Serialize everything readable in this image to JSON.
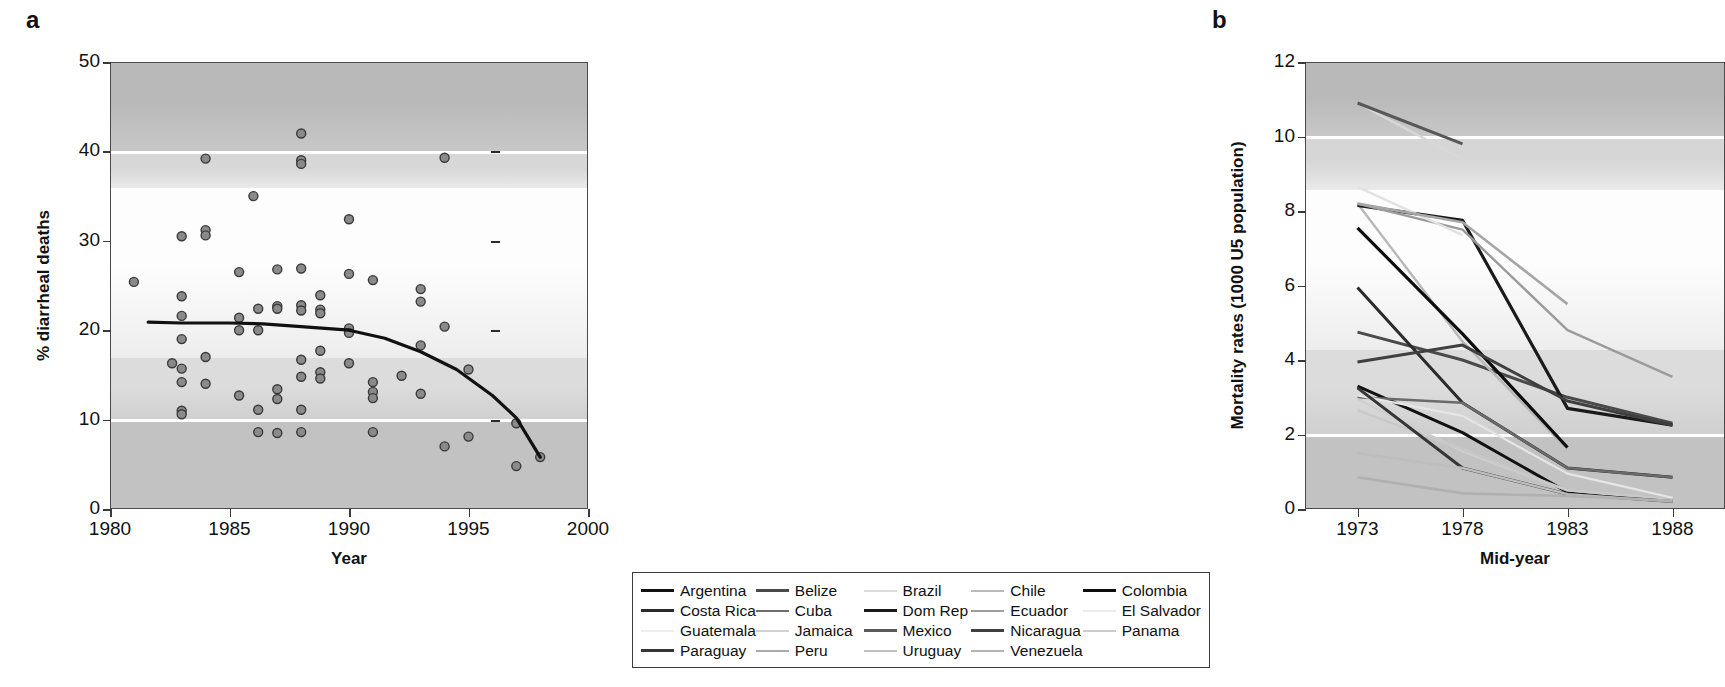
{
  "figure": {
    "panel_a_label": "a",
    "panel_b_label": "b"
  },
  "chart_data": [
    {
      "id": "panel_a",
      "type": "scatter",
      "title": "",
      "xlabel": "Year",
      "ylabel": "% diarrheal deaths",
      "xlim": [
        1980,
        2000
      ],
      "ylim": [
        0,
        50
      ],
      "xticks": [
        1980,
        1985,
        1990,
        1995,
        2000
      ],
      "xtick_labels": [
        "1980",
        "1985",
        "1990",
        "1995",
        "2000"
      ],
      "yticks": [
        0,
        10,
        20,
        30,
        40,
        50
      ],
      "ytick_labels": [
        "0",
        "10",
        "20",
        "30",
        "40",
        "50"
      ],
      "grid": false,
      "background_bands": [
        {
          "from": 50,
          "to": 40,
          "shade": "#b9b9b9"
        },
        {
          "from": 40,
          "to": 36,
          "shade": "#d7d7d7"
        },
        {
          "from": 36,
          "to": 17,
          "shade": "#fdfdfd"
        },
        {
          "from": 17,
          "to": 10,
          "shade": "#dcdcdc"
        },
        {
          "from": 10,
          "to": 0,
          "shade": "#c2c2c2"
        }
      ],
      "white_rule_lines": [
        40,
        10
      ],
      "inner_right_ticks": [
        40,
        30,
        20,
        10
      ],
      "marker_style": {
        "shape": "circle",
        "fill": "#8a8a8a",
        "edge": "#3a3a3a",
        "size": 9
      },
      "points": [
        {
          "x": 1981.0,
          "y": 25.4
        },
        {
          "x": 1983.0,
          "y": 30.5
        },
        {
          "x": 1983.0,
          "y": 23.8
        },
        {
          "x": 1983.0,
          "y": 21.6
        },
        {
          "x": 1983.0,
          "y": 19.0
        },
        {
          "x": 1983.0,
          "y": 15.7
        },
        {
          "x": 1983.0,
          "y": 14.2
        },
        {
          "x": 1983.0,
          "y": 11.0
        },
        {
          "x": 1983.0,
          "y": 10.6
        },
        {
          "x": 1982.6,
          "y": 16.3
        },
        {
          "x": 1984.0,
          "y": 39.2
        },
        {
          "x": 1984.0,
          "y": 31.2
        },
        {
          "x": 1984.0,
          "y": 30.6
        },
        {
          "x": 1984.0,
          "y": 17.0
        },
        {
          "x": 1984.0,
          "y": 14.0
        },
        {
          "x": 1985.4,
          "y": 26.5
        },
        {
          "x": 1985.4,
          "y": 21.4
        },
        {
          "x": 1985.4,
          "y": 20.0
        },
        {
          "x": 1985.4,
          "y": 12.7
        },
        {
          "x": 1986.0,
          "y": 35.0
        },
        {
          "x": 1986.2,
          "y": 22.4
        },
        {
          "x": 1986.2,
          "y": 20.0
        },
        {
          "x": 1986.2,
          "y": 11.1
        },
        {
          "x": 1986.2,
          "y": 8.6
        },
        {
          "x": 1987.0,
          "y": 26.8
        },
        {
          "x": 1987.0,
          "y": 22.7
        },
        {
          "x": 1987.0,
          "y": 22.4
        },
        {
          "x": 1987.0,
          "y": 13.4
        },
        {
          "x": 1987.0,
          "y": 12.3
        },
        {
          "x": 1987.0,
          "y": 8.5
        },
        {
          "x": 1988.0,
          "y": 42.0
        },
        {
          "x": 1988.0,
          "y": 39.0
        },
        {
          "x": 1988.0,
          "y": 38.6
        },
        {
          "x": 1988.0,
          "y": 26.9
        },
        {
          "x": 1988.0,
          "y": 22.8
        },
        {
          "x": 1988.0,
          "y": 22.2
        },
        {
          "x": 1988.0,
          "y": 16.7
        },
        {
          "x": 1988.0,
          "y": 14.8
        },
        {
          "x": 1988.0,
          "y": 11.1
        },
        {
          "x": 1988.0,
          "y": 8.6
        },
        {
          "x": 1988.8,
          "y": 23.9
        },
        {
          "x": 1988.8,
          "y": 22.3
        },
        {
          "x": 1988.8,
          "y": 21.9
        },
        {
          "x": 1988.8,
          "y": 17.7
        },
        {
          "x": 1988.8,
          "y": 15.3
        },
        {
          "x": 1988.8,
          "y": 14.6
        },
        {
          "x": 1990.0,
          "y": 32.4
        },
        {
          "x": 1990.0,
          "y": 26.3
        },
        {
          "x": 1990.0,
          "y": 20.2
        },
        {
          "x": 1990.0,
          "y": 19.7
        },
        {
          "x": 1990.0,
          "y": 16.3
        },
        {
          "x": 1991.0,
          "y": 25.6
        },
        {
          "x": 1991.0,
          "y": 14.2
        },
        {
          "x": 1991.0,
          "y": 13.1
        },
        {
          "x": 1991.0,
          "y": 12.4
        },
        {
          "x": 1991.0,
          "y": 8.6
        },
        {
          "x": 1992.2,
          "y": 14.9
        },
        {
          "x": 1993.0,
          "y": 24.6
        },
        {
          "x": 1993.0,
          "y": 23.2
        },
        {
          "x": 1993.0,
          "y": 18.3
        },
        {
          "x": 1993.0,
          "y": 12.9
        },
        {
          "x": 1994.0,
          "y": 39.3
        },
        {
          "x": 1994.0,
          "y": 20.4
        },
        {
          "x": 1994.0,
          "y": 7.0
        },
        {
          "x": 1995.0,
          "y": 15.6
        },
        {
          "x": 1995.0,
          "y": 8.1
        },
        {
          "x": 1997.0,
          "y": 9.6
        },
        {
          "x": 1997.0,
          "y": 4.8
        },
        {
          "x": 1998.0,
          "y": 5.8
        }
      ],
      "trend_line": {
        "label": "fitted trend",
        "color": "#111111",
        "width": 3.2,
        "points": [
          {
            "x": 1981.6,
            "y": 20.9
          },
          {
            "x": 1983.0,
            "y": 20.8
          },
          {
            "x": 1985.0,
            "y": 20.8
          },
          {
            "x": 1986.4,
            "y": 20.7
          },
          {
            "x": 1988.0,
            "y": 20.4
          },
          {
            "x": 1990.0,
            "y": 20.0
          },
          {
            "x": 1991.5,
            "y": 19.1
          },
          {
            "x": 1993.0,
            "y": 17.6
          },
          {
            "x": 1994.5,
            "y": 15.6
          },
          {
            "x": 1996.0,
            "y": 12.7
          },
          {
            "x": 1997.0,
            "y": 10.2
          },
          {
            "x": 1998.0,
            "y": 5.8
          }
        ]
      }
    },
    {
      "id": "panel_b",
      "type": "line",
      "title": "",
      "xlabel": "Mid-year",
      "ylabel": "Mortality rates (1000 U5 population)",
      "x": [
        1973,
        1978,
        1983,
        1988
      ],
      "xticks": [
        1973,
        1978,
        1983,
        1988
      ],
      "xtick_labels": [
        "1973",
        "1978",
        "1983",
        "1988"
      ],
      "xlim": [
        1970.5,
        1990.5
      ],
      "ylim": [
        0,
        12
      ],
      "yticks": [
        0,
        2,
        4,
        6,
        8,
        10,
        12
      ],
      "ytick_labels": [
        "0",
        "2",
        "4",
        "6",
        "8",
        "10",
        "12"
      ],
      "grid": false,
      "legend_position": "below",
      "background_bands": [
        {
          "from": 12,
          "to": 10,
          "shade": "#b9b9b9"
        },
        {
          "from": 10,
          "to": 8.6,
          "shade": "#d6d6d6"
        },
        {
          "from": 8.6,
          "to": 4.3,
          "shade": "#fdfdfd"
        },
        {
          "from": 4.3,
          "to": 2.0,
          "shade": "#dcdcdc"
        },
        {
          "from": 2.0,
          "to": 0,
          "shade": "#c2c2c2"
        }
      ],
      "white_rule_lines": [
        10,
        2
      ],
      "series": [
        {
          "name": "Argentina",
          "color": "#111111",
          "width": 3.0,
          "values": [
            3.3,
            2.05,
            0.45,
            0.22
          ]
        },
        {
          "name": "Belize",
          "color": "#4a4a4a",
          "width": 3.0,
          "values": [
            4.75,
            4.0,
            3.0,
            2.3
          ]
        },
        {
          "name": "Brazil",
          "color": "#d8d8d8",
          "width": 2.4,
          "values": [
            10.9,
            9.4,
            null,
            null
          ]
        },
        {
          "name": "Chile",
          "color": "#b8b8b8",
          "width": 2.4,
          "values": [
            8.2,
            4.5,
            1.6,
            null
          ]
        },
        {
          "name": "Colombia",
          "color": "#0d0d0d",
          "width": 3.2,
          "values": [
            7.55,
            4.7,
            1.65,
            null
          ]
        },
        {
          "name": "Costa Rica",
          "color": "#2a2a2a",
          "width": 3.0,
          "values": [
            5.95,
            2.85,
            1.1,
            0.85
          ]
        },
        {
          "name": "Cuba",
          "color": "#6a6a6a",
          "width": 2.6,
          "values": [
            3.0,
            2.85,
            1.1,
            0.85
          ]
        },
        {
          "name": "Dom Rep",
          "color": "#1a1a1a",
          "width": 3.2,
          "values": [
            8.15,
            7.75,
            2.7,
            2.25
          ]
        },
        {
          "name": "Ecuador",
          "color": "#9a9a9a",
          "width": 2.4,
          "values": [
            8.2,
            7.5,
            4.8,
            3.55
          ]
        },
        {
          "name": "El Salvador",
          "color": "#e2e2e2",
          "width": 2.4,
          "values": [
            8.65,
            7.35,
            null,
            null
          ]
        },
        {
          "name": "Guatemala",
          "color": "#e6e6e6",
          "width": 2.2,
          "values": [
            3.05,
            2.5,
            0.95,
            0.3
          ]
        },
        {
          "name": "Jamaica",
          "color": "#cfcfcf",
          "width": 2.4,
          "values": [
            2.95,
            1.55,
            0.5,
            0.25
          ]
        },
        {
          "name": "Mexico",
          "color": "#585858",
          "width": 3.0,
          "values": [
            10.9,
            9.8,
            null,
            null
          ]
        },
        {
          "name": "Nicaragua",
          "color": "#3f3f3f",
          "width": 3.0,
          "values": [
            3.95,
            4.4,
            2.9,
            2.25
          ]
        },
        {
          "name": "Panama",
          "color": "#c8c8c8",
          "width": 2.4,
          "values": [
            2.65,
            1.6,
            0.5,
            0.25
          ]
        },
        {
          "name": "Paraguay",
          "color": "#353535",
          "width": 3.0,
          "values": [
            3.25,
            1.1,
            0.4,
            0.2
          ]
        },
        {
          "name": "Peru",
          "color": "#a6a6a6",
          "width": 2.6,
          "values": [
            8.2,
            7.7,
            5.5,
            null
          ]
        },
        {
          "name": "Uruguay",
          "color": "#bdbdbd",
          "width": 2.4,
          "values": [
            1.5,
            1.1,
            0.4,
            0.2
          ]
        },
        {
          "name": "Venezuela",
          "color": "#b0b0b0",
          "width": 2.6,
          "values": [
            0.85,
            0.42,
            0.35,
            0.22
          ]
        }
      ]
    }
  ],
  "legend": {
    "columns": 5,
    "items": [
      {
        "label": "Argentina",
        "color": "#111111",
        "width": 3.4
      },
      {
        "label": "Belize",
        "color": "#4a4a4a",
        "width": 3.2
      },
      {
        "label": "Brazil",
        "color": "#dddddd",
        "width": 2.2
      },
      {
        "label": "Chile",
        "color": "#bbbbbb",
        "width": 2.2
      },
      {
        "label": "Colombia",
        "color": "#0d0d0d",
        "width": 3.6
      },
      {
        "label": "Costa Rica",
        "color": "#2a2a2a",
        "width": 3.2
      },
      {
        "label": "Cuba",
        "color": "#6e6e6e",
        "width": 2.6
      },
      {
        "label": "Dom Rep",
        "color": "#1a1a1a",
        "width": 3.6
      },
      {
        "label": "Ecuador",
        "color": "#9e9e9e",
        "width": 2.2
      },
      {
        "label": "El Salvador",
        "color": "#ececec",
        "width": 2.0
      },
      {
        "label": "Guatemala",
        "color": "#ededed",
        "width": 2.0
      },
      {
        "label": "Jamaica",
        "color": "#d2d2d2",
        "width": 2.2
      },
      {
        "label": "Mexico",
        "color": "#5a5a5a",
        "width": 3.0
      },
      {
        "label": "Nicaragua",
        "color": "#3f3f3f",
        "width": 3.0
      },
      {
        "label": "Panama",
        "color": "#cccccc",
        "width": 2.4
      },
      {
        "label": "Paraguay",
        "color": "#353535",
        "width": 3.0
      },
      {
        "label": "Peru",
        "color": "#aaaaaa",
        "width": 2.6
      },
      {
        "label": "Uruguay",
        "color": "#c0c0c0",
        "width": 2.2
      },
      {
        "label": "Venezuela",
        "color": "#b4b4b4",
        "width": 2.6
      }
    ]
  }
}
